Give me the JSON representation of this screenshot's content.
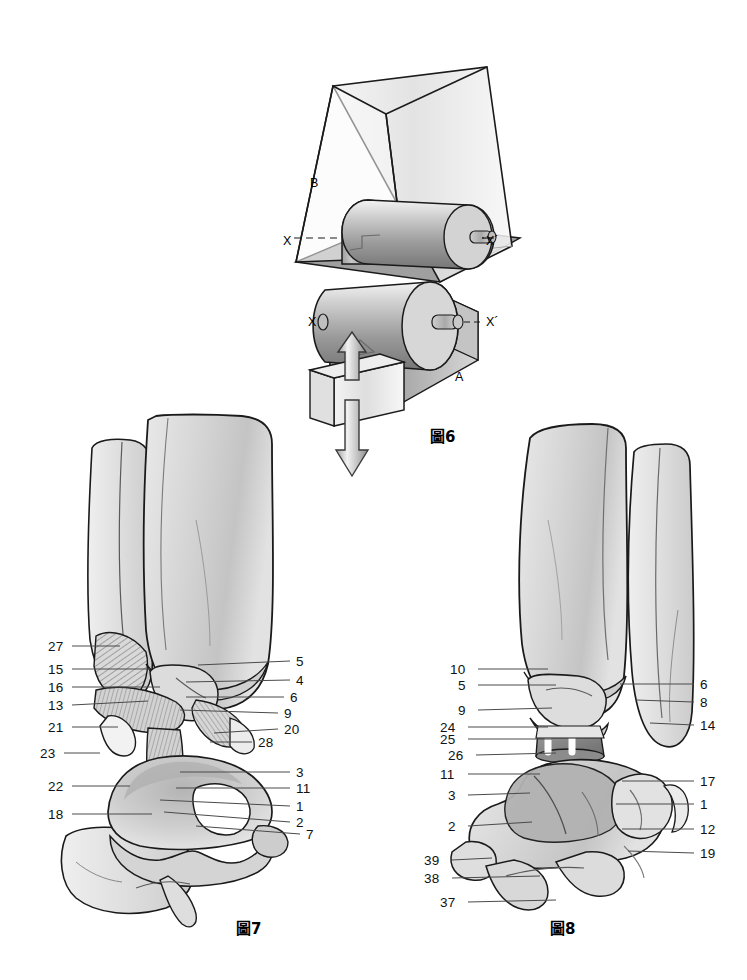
{
  "page": {
    "width": 747,
    "height": 980,
    "background": "#ffffff",
    "ink": "#1a1a1a"
  },
  "figures": [
    {
      "id": "fig6",
      "caption": "圖6",
      "caption_pos": {
        "x": 430,
        "y": 425
      },
      "markers": [
        {
          "name": "marker-b",
          "text": "B",
          "x": 310,
          "y": 176
        },
        {
          "name": "marker-x-upper",
          "text": "X",
          "x": 283,
          "y": 234
        },
        {
          "name": "marker-xprime-upper",
          "text": "X´",
          "x": 486,
          "y": 234
        },
        {
          "name": "marker-x-lower",
          "text": "X",
          "x": 308,
          "y": 315
        },
        {
          "name": "marker-xprime-lower",
          "text": "X´",
          "x": 486,
          "y": 315
        },
        {
          "name": "marker-a",
          "text": "A",
          "x": 455,
          "y": 370
        }
      ]
    },
    {
      "id": "fig7",
      "caption": "圖7",
      "caption_pos": {
        "x": 236,
        "y": 917
      },
      "left_labels": [
        {
          "n": "27",
          "x": 48,
          "y": 640,
          "lx1": 72,
          "ly1": 646,
          "lx2": 120,
          "ly2": 646
        },
        {
          "n": "15",
          "x": 48,
          "y": 663,
          "lx1": 72,
          "ly1": 669,
          "lx2": 150,
          "ly2": 669
        },
        {
          "n": "16",
          "x": 48,
          "y": 681,
          "lx1": 72,
          "ly1": 687,
          "lx2": 160,
          "ly2": 687
        },
        {
          "n": "13",
          "x": 48,
          "y": 699,
          "lx1": 72,
          "ly1": 705,
          "lx2": 148,
          "ly2": 701
        },
        {
          "n": "21",
          "x": 48,
          "y": 721,
          "lx1": 72,
          "ly1": 727,
          "lx2": 118,
          "ly2": 727
        },
        {
          "n": "23",
          "x": 40,
          "y": 747,
          "lx1": 64,
          "ly1": 753,
          "lx2": 100,
          "ly2": 753
        },
        {
          "n": "22",
          "x": 48,
          "y": 780,
          "lx1": 72,
          "ly1": 786,
          "lx2": 130,
          "ly2": 786
        },
        {
          "n": "18",
          "x": 48,
          "y": 808,
          "lx1": 72,
          "ly1": 814,
          "lx2": 152,
          "ly2": 814
        }
      ],
      "right_labels": [
        {
          "n": "5",
          "x": 296,
          "y": 655,
          "lx1": 290,
          "ly1": 661,
          "lx2": 198,
          "ly2": 665
        },
        {
          "n": "4",
          "x": 296,
          "y": 674,
          "lx1": 290,
          "ly1": 680,
          "lx2": 186,
          "ly2": 682
        },
        {
          "n": "6",
          "x": 290,
          "y": 691,
          "lx1": 284,
          "ly1": 697,
          "lx2": 186,
          "ly2": 697
        },
        {
          "n": "9",
          "x": 284,
          "y": 707,
          "lx1": 278,
          "ly1": 713,
          "lx2": 180,
          "ly2": 710
        },
        {
          "n": "20",
          "x": 284,
          "y": 723,
          "lx1": 278,
          "ly1": 729,
          "lx2": 214,
          "ly2": 733
        },
        {
          "n": "28",
          "x": 258,
          "y": 736,
          "lx1": 252,
          "ly1": 742,
          "lx2": 210,
          "ly2": 742
        },
        {
          "n": "3",
          "x": 296,
          "y": 766,
          "lx1": 290,
          "ly1": 772,
          "lx2": 180,
          "ly2": 772
        },
        {
          "n": "11",
          "x": 296,
          "y": 782,
          "lx1": 290,
          "ly1": 788,
          "lx2": 176,
          "ly2": 788
        },
        {
          "n": "1",
          "x": 296,
          "y": 800,
          "lx1": 290,
          "ly1": 806,
          "lx2": 160,
          "ly2": 800
        },
        {
          "n": "2",
          "x": 296,
          "y": 816,
          "lx1": 290,
          "ly1": 822,
          "lx2": 164,
          "ly2": 812
        },
        {
          "n": "7",
          "x": 306,
          "y": 828,
          "lx1": 300,
          "ly1": 834,
          "lx2": 196,
          "ly2": 826
        }
      ]
    },
    {
      "id": "fig8",
      "caption": "圖8",
      "caption_pos": {
        "x": 550,
        "y": 917
      },
      "left_labels": [
        {
          "n": "10",
          "x": 450,
          "y": 663,
          "lx1": 478,
          "ly1": 669,
          "lx2": 548,
          "ly2": 669
        },
        {
          "n": "5",
          "x": 458,
          "y": 679,
          "lx1": 478,
          "ly1": 685,
          "lx2": 556,
          "ly2": 685
        },
        {
          "n": "9",
          "x": 458,
          "y": 704,
          "lx1": 478,
          "ly1": 710,
          "lx2": 552,
          "ly2": 708
        },
        {
          "n": "24",
          "x": 440,
          "y": 721,
          "lx1": 468,
          "ly1": 727,
          "lx2": 548,
          "ly2": 727
        },
        {
          "n": "25",
          "x": 440,
          "y": 733,
          "lx1": 468,
          "ly1": 739,
          "lx2": 552,
          "ly2": 739
        },
        {
          "n": "26",
          "x": 448,
          "y": 749,
          "lx1": 476,
          "ly1": 755,
          "lx2": 556,
          "ly2": 753
        },
        {
          "n": "11",
          "x": 440,
          "y": 768,
          "lx1": 468,
          "ly1": 774,
          "lx2": 540,
          "ly2": 774
        },
        {
          "n": "3",
          "x": 448,
          "y": 789,
          "lx1": 468,
          "ly1": 795,
          "lx2": 530,
          "ly2": 793
        },
        {
          "n": "2",
          "x": 448,
          "y": 820,
          "lx1": 468,
          "ly1": 826,
          "lx2": 532,
          "ly2": 822
        },
        {
          "n": "39",
          "x": 424,
          "y": 854,
          "lx1": 452,
          "ly1": 860,
          "lx2": 492,
          "ly2": 858
        },
        {
          "n": "38",
          "x": 424,
          "y": 872,
          "lx1": 452,
          "ly1": 878,
          "lx2": 540,
          "ly2": 876
        },
        {
          "n": "37",
          "x": 440,
          "y": 896,
          "lx1": 468,
          "ly1": 902,
          "lx2": 556,
          "ly2": 900
        }
      ],
      "right_labels": [
        {
          "n": "6",
          "x": 700,
          "y": 678,
          "lx1": 694,
          "ly1": 684,
          "lx2": 620,
          "ly2": 684
        },
        {
          "n": "8",
          "x": 700,
          "y": 696,
          "lx1": 694,
          "ly1": 702,
          "lx2": 636,
          "ly2": 700
        },
        {
          "n": "14",
          "x": 700,
          "y": 719,
          "lx1": 694,
          "ly1": 725,
          "lx2": 650,
          "ly2": 723
        },
        {
          "n": "17",
          "x": 700,
          "y": 775,
          "lx1": 694,
          "ly1": 781,
          "lx2": 622,
          "ly2": 781
        },
        {
          "n": "1",
          "x": 700,
          "y": 798,
          "lx1": 694,
          "ly1": 804,
          "lx2": 616,
          "ly2": 804
        },
        {
          "n": "12",
          "x": 700,
          "y": 823,
          "lx1": 694,
          "ly1": 829,
          "lx2": 622,
          "ly2": 829
        },
        {
          "n": "19",
          "x": 700,
          "y": 847,
          "lx1": 694,
          "ly1": 853,
          "lx2": 628,
          "ly2": 851
        }
      ]
    }
  ]
}
